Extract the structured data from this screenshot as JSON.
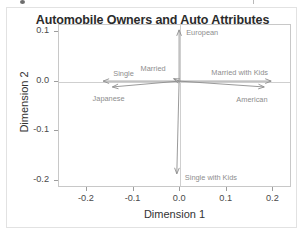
{
  "chart_data": {
    "type": "scatter",
    "title": "Automobile Owners and Auto Attributes",
    "xlabel": "Dimension 1",
    "ylabel": "Dimension 2",
    "xlim": [
      -0.26,
      0.24
    ],
    "ylim": [
      -0.215,
      0.115
    ],
    "xticks": [
      "-0.2",
      "-0.1",
      "0.0",
      "0.1",
      "0.2"
    ],
    "xtick_values": [
      -0.2,
      -0.1,
      0.0,
      0.1,
      0.2
    ],
    "yticks": [
      "0.1",
      "0.0",
      "-0.1",
      "-0.2"
    ],
    "ytick_values": [
      0.1,
      0.0,
      -0.1,
      -0.2
    ],
    "grid": false,
    "legend": "none",
    "origin": [
      0.0,
      0.0
    ],
    "vectors": [
      {
        "label": "European",
        "x": 0.0,
        "y": 0.105,
        "label_dx": 6,
        "label_dy": -1
      },
      {
        "label": "Single",
        "x": -0.165,
        "y": 0.0,
        "label_dx": 10,
        "label_dy": -12
      },
      {
        "label": "Married",
        "x": -0.012,
        "y": 0.005,
        "label_dx": -34,
        "label_dy": -14
      },
      {
        "label": "Married with Kids",
        "x": 0.2,
        "y": 0.0,
        "label_dx": -62,
        "label_dy": -13
      },
      {
        "label": "Japanese",
        "x": -0.145,
        "y": -0.012,
        "label_dx": -20,
        "label_dy": 7
      },
      {
        "label": "American",
        "x": 0.185,
        "y": -0.012,
        "label_dx": -30,
        "label_dy": 8
      },
      {
        "label": "Single with Kids",
        "x": -0.005,
        "y": -0.19,
        "label_dx": 7,
        "label_dy": -2
      }
    ],
    "colors": {
      "vector": "#8d8d8d",
      "axis": "#c8c8c8",
      "zero_line": "#cfcfcf",
      "title": "#2b2b2b",
      "tick_text": "#4a4a4a",
      "vector_label": "#8d8d8d",
      "background": "#ffffff"
    }
  }
}
